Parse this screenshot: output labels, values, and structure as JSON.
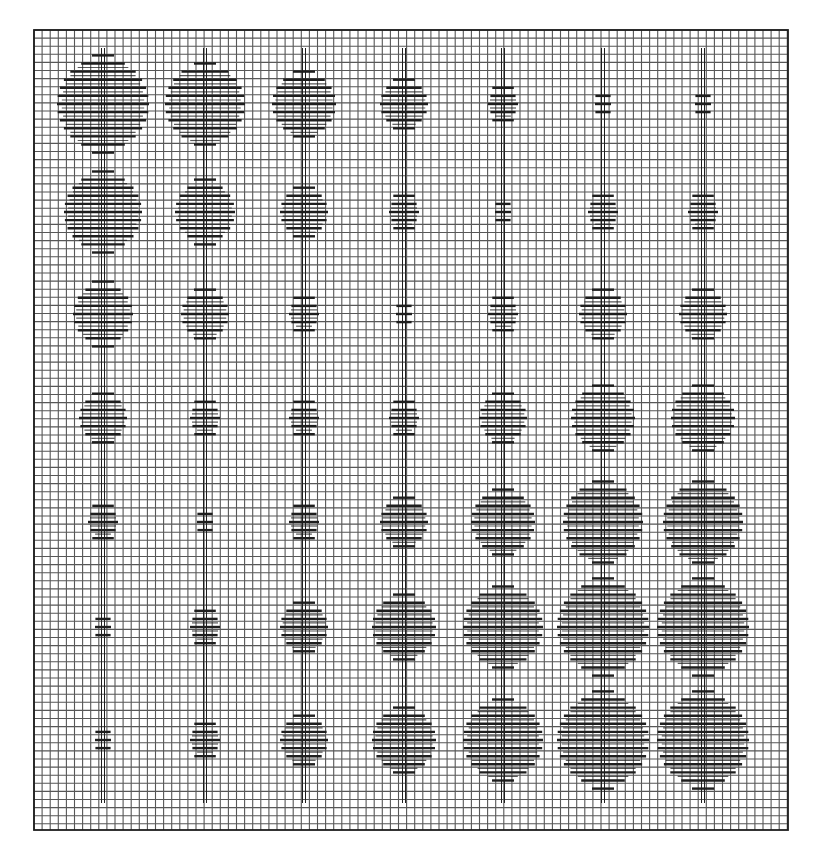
{
  "figure": {
    "title": ""
  },
  "colors": {
    "paper": "#ffffff",
    "grid": "#3a3a3a",
    "ink": "#1e1e1e"
  },
  "grid": {
    "x0": 34,
    "y0": 30,
    "x1": 788,
    "y1": 830,
    "pitch": 8.1,
    "line_width": 1.1,
    "frame_width": 1.8
  },
  "rods": {
    "top": 48,
    "bottom": 803,
    "gap": 3
  },
  "diagram": {
    "type": "bead-grid",
    "columns_x": [
      103,
      205,
      304,
      404,
      503,
      603,
      703
    ],
    "rows_y": [
      104,
      212,
      314,
      418,
      522,
      627,
      740
    ],
    "blob_half_widths": [
      [
        46,
        40,
        32,
        24,
        15,
        8,
        8
      ],
      [
        39,
        30,
        24,
        15,
        8,
        15,
        15
      ],
      [
        30,
        24,
        15,
        8,
        15,
        24,
        24
      ],
      [
        24,
        15,
        15,
        15,
        24,
        32,
        32
      ],
      [
        15,
        8,
        15,
        24,
        32,
        40,
        40
      ],
      [
        8,
        15,
        24,
        32,
        40,
        46,
        46
      ],
      [
        8,
        15,
        24,
        32,
        40,
        46,
        46
      ]
    ],
    "note": "Left columns shrink top-to-bottom; right columns grow top-to-bottom"
  }
}
